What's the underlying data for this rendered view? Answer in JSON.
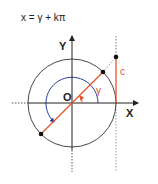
{
  "formula": "x = γ + kπ",
  "labels": {
    "y_axis": "Y",
    "x_axis": "X",
    "origin": "O",
    "angle": "γ",
    "tangent": "c"
  },
  "colors": {
    "axis": "#222222",
    "circle": "#333333",
    "arc": "#2a3f9a",
    "ray": "#e2532a",
    "angle_label": "#e2532a"
  }
}
